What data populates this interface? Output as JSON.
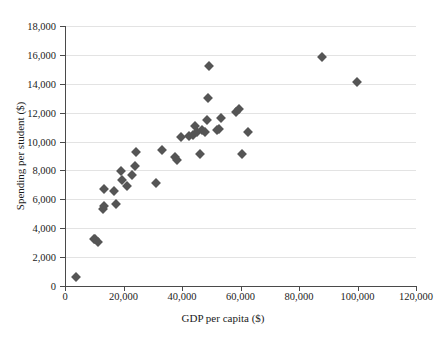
{
  "chart_data": {
    "type": "scatter",
    "title": "",
    "xlabel": "GDP per capita ($)",
    "ylabel": "Spending per student ($)",
    "xlim": [
      0,
      120000
    ],
    "ylim": [
      0,
      18000
    ],
    "grid": true,
    "legend": "none",
    "marker": {
      "shape": "diamond",
      "color": "#555555",
      "size": 7
    },
    "xticks": [
      0,
      20000,
      40000,
      60000,
      80000,
      100000,
      120000
    ],
    "xticklabels": [
      "0",
      "20,000",
      "40,000",
      "60,000",
      "80,000",
      "100,000",
      "120,000"
    ],
    "yticks": [
      0,
      2000,
      4000,
      6000,
      8000,
      10000,
      12000,
      14000,
      16000,
      18000
    ],
    "yticklabels": [
      "0",
      "2,000",
      "4,000",
      "6,000",
      "8,000",
      "10,000",
      "12,000",
      "14,000",
      "16,000",
      "18,000"
    ],
    "points": [
      {
        "x": 3700,
        "y": 640
      },
      {
        "x": 9800,
        "y": 3280
      },
      {
        "x": 10400,
        "y": 3250
      },
      {
        "x": 11400,
        "y": 3050
      },
      {
        "x": 13000,
        "y": 5350
      },
      {
        "x": 13400,
        "y": 5550
      },
      {
        "x": 13500,
        "y": 6750
      },
      {
        "x": 16800,
        "y": 6550
      },
      {
        "x": 17600,
        "y": 5650
      },
      {
        "x": 19200,
        "y": 7950
      },
      {
        "x": 19500,
        "y": 7350
      },
      {
        "x": 21200,
        "y": 6900
      },
      {
        "x": 22800,
        "y": 7700
      },
      {
        "x": 23800,
        "y": 8300
      },
      {
        "x": 24200,
        "y": 9250
      },
      {
        "x": 31000,
        "y": 7100
      },
      {
        "x": 33200,
        "y": 9450
      },
      {
        "x": 37500,
        "y": 8950
      },
      {
        "x": 38200,
        "y": 8750
      },
      {
        "x": 39500,
        "y": 10350
      },
      {
        "x": 42500,
        "y": 10400
      },
      {
        "x": 43800,
        "y": 10450
      },
      {
        "x": 44500,
        "y": 11100
      },
      {
        "x": 45200,
        "y": 10650
      },
      {
        "x": 46000,
        "y": 9150
      },
      {
        "x": 47000,
        "y": 10800
      },
      {
        "x": 47800,
        "y": 10650
      },
      {
        "x": 48600,
        "y": 11500
      },
      {
        "x": 49000,
        "y": 13050
      },
      {
        "x": 49200,
        "y": 15250
      },
      {
        "x": 52000,
        "y": 10800
      },
      {
        "x": 52600,
        "y": 10900
      },
      {
        "x": 53500,
        "y": 11650
      },
      {
        "x": 58500,
        "y": 12050
      },
      {
        "x": 59500,
        "y": 12250
      },
      {
        "x": 60500,
        "y": 9150
      },
      {
        "x": 62500,
        "y": 10650
      },
      {
        "x": 87800,
        "y": 15850
      },
      {
        "x": 99800,
        "y": 14100
      }
    ]
  }
}
